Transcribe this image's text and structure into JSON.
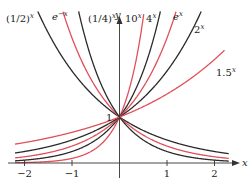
{
  "chart_data": {
    "type": "line",
    "title": "",
    "xlabel": "x",
    "ylabel": "y",
    "xlim": [
      -2.2,
      2.3
    ],
    "ylim": [
      0,
      3.3
    ],
    "grid": false,
    "x_ticks": [
      -2,
      -1,
      1,
      2
    ],
    "x_tick_labels": [
      "−2",
      "−1",
      "1",
      "2"
    ],
    "y_marked": [
      {
        "value": 1,
        "label": "1"
      }
    ],
    "colors": {
      "black": "#2b2b2b",
      "red": "#e0505a"
    },
    "series": [
      {
        "name": "(1/2)^x",
        "base": 0.5,
        "color": "black"
      },
      {
        "name": "e^-x",
        "base": 0.36788,
        "color": "red"
      },
      {
        "name": "(1/4)^x",
        "base": 0.25,
        "color": "black"
      },
      {
        "name": "10^x",
        "base": 10,
        "color": "red"
      },
      {
        "name": "4^x",
        "base": 4,
        "color": "black"
      },
      {
        "name": "e^x",
        "base": 2.71828,
        "color": "red"
      },
      {
        "name": "2^x",
        "base": 2,
        "color": "black"
      },
      {
        "name": "1.5^x",
        "base": 1.5,
        "color": "red"
      }
    ],
    "labels": {
      "half": {
        "base": "(1/2)",
        "exp": "x"
      },
      "eneg": {
        "base": "e",
        "exp": "−x"
      },
      "quarter": {
        "base": "(1/4)",
        "exp": "x"
      },
      "ten": {
        "base": "10",
        "exp": "x"
      },
      "four": {
        "base": "4",
        "exp": "x"
      },
      "e": {
        "base": "e",
        "exp": "x"
      },
      "two": {
        "base": "2",
        "exp": "x"
      },
      "onehalf": {
        "base": "1.5",
        "exp": "x"
      }
    }
  }
}
